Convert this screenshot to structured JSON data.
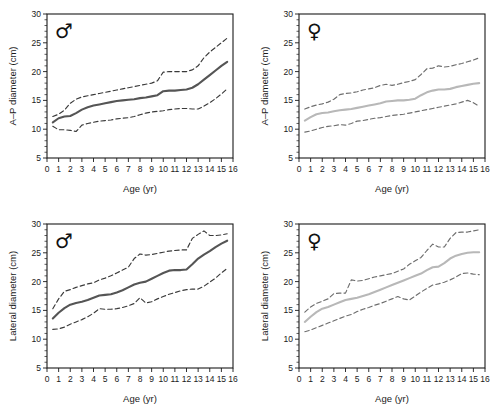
{
  "figure": {
    "title": "",
    "panels": [
      {
        "id": "ap-male",
        "sex_symbol": "♂",
        "sex_label": "male",
        "xlabel": "Age (yr)",
        "ylabel": "A–P diameter (cm)"
      },
      {
        "id": "ap-female",
        "sex_symbol": "♀",
        "sex_label": "female",
        "xlabel": "Age (yr)",
        "ylabel": "A–P diameter (cm)"
      },
      {
        "id": "lat-male",
        "sex_symbol": "♂",
        "sex_label": "male",
        "xlabel": "Age (yr)",
        "ylabel": "Lateral diameter (cm)"
      },
      {
        "id": "lat-female",
        "sex_symbol": "♀",
        "sex_label": "female",
        "xlabel": "Age (yr)",
        "ylabel": "Lateral diameter (cm)"
      }
    ]
  },
  "colors": {
    "axis": "#1a1a1a",
    "median_male": "#555555",
    "median_female": "#b8b8b8",
    "bound_male": "#3a3a3a",
    "bound_female": "#6e6e6e",
    "background": "#ffffff"
  },
  "chart_data": [
    {
      "type": "line",
      "id": "ap-male",
      "title": "A–P diameter, male",
      "xlabel": "Age (yr)",
      "ylabel": "A–P diameter (cm)",
      "xlim": [
        0,
        16
      ],
      "ylim": [
        5,
        30
      ],
      "xticks": [
        0,
        1,
        2,
        3,
        4,
        5,
        6,
        7,
        8,
        9,
        10,
        11,
        12,
        13,
        14,
        15,
        16
      ],
      "xticklabels": [
        "0",
        "1",
        "2",
        "3",
        "4",
        "5",
        "6",
        "7",
        "8",
        "9",
        "10",
        "11",
        "12",
        "13",
        "14",
        "15",
        "16"
      ],
      "yticks": [
        5,
        10,
        15,
        20,
        25,
        30
      ],
      "yticklabels": [
        "5",
        "10",
        "15",
        "20",
        "25",
        "30"
      ],
      "grid": false,
      "legend": "none",
      "annotations": [
        "♂"
      ],
      "x": [
        0.5,
        1,
        1.5,
        2,
        2.5,
        3,
        3.5,
        4,
        4.5,
        5,
        5.5,
        6,
        6.5,
        7,
        7.5,
        8,
        8.5,
        9,
        9.5,
        10,
        10.5,
        11,
        11.5,
        12,
        12.5,
        13,
        13.5,
        14,
        14.5,
        15,
        15.5
      ],
      "series": [
        {
          "name": "upper limit",
          "style": "dashed",
          "color": "#3a3a3a",
          "values": [
            12.2,
            12.6,
            13.3,
            14.5,
            15.2,
            15.6,
            15.8,
            16.0,
            16.2,
            16.4,
            16.6,
            16.8,
            17.0,
            17.2,
            17.4,
            17.6,
            17.8,
            18.0,
            18.4,
            19.9,
            20.0,
            20.0,
            20.0,
            20.0,
            20.3,
            21.0,
            22.4,
            23.4,
            24.2,
            25.0,
            25.8
          ]
        },
        {
          "name": "median",
          "style": "solid",
          "color": "#555555",
          "values": [
            11.2,
            11.9,
            12.2,
            12.3,
            12.8,
            13.4,
            13.8,
            14.1,
            14.3,
            14.5,
            14.7,
            14.9,
            15.0,
            15.1,
            15.2,
            15.4,
            15.5,
            15.7,
            15.9,
            16.6,
            16.7,
            16.7,
            16.8,
            16.9,
            17.2,
            17.8,
            18.6,
            19.4,
            20.2,
            21.0,
            21.7
          ]
        },
        {
          "name": "lower limit",
          "style": "dashed",
          "color": "#3a3a3a",
          "values": [
            10.5,
            9.9,
            9.9,
            9.8,
            9.6,
            10.7,
            11.0,
            11.2,
            11.4,
            11.5,
            11.6,
            11.8,
            11.9,
            12.0,
            12.2,
            12.5,
            12.8,
            13.0,
            13.1,
            13.2,
            13.4,
            13.5,
            13.6,
            13.6,
            13.5,
            13.5,
            14.0,
            14.6,
            15.3,
            16.1,
            17.0
          ]
        }
      ]
    },
    {
      "type": "line",
      "id": "ap-female",
      "title": "A–P diameter, female",
      "xlabel": "Age (yr)",
      "ylabel": "A–P diameter (cm)",
      "xlim": [
        0,
        16
      ],
      "ylim": [
        5,
        30
      ],
      "xticks": [
        0,
        1,
        2,
        3,
        4,
        5,
        6,
        7,
        8,
        9,
        10,
        11,
        12,
        13,
        14,
        15,
        16
      ],
      "xticklabels": [
        "0",
        "1",
        "2",
        "3",
        "4",
        "5",
        "6",
        "7",
        "8",
        "9",
        "10",
        "11",
        "12",
        "13",
        "14",
        "15",
        "16"
      ],
      "yticks": [
        5,
        10,
        15,
        20,
        25,
        30
      ],
      "yticklabels": [
        "5",
        "10",
        "15",
        "20",
        "25",
        "30"
      ],
      "grid": false,
      "legend": "none",
      "annotations": [
        "♀"
      ],
      "x": [
        0.5,
        1,
        1.5,
        2,
        2.5,
        3,
        3.5,
        4,
        4.5,
        5,
        5.5,
        6,
        6.5,
        7,
        7.5,
        8,
        8.5,
        9,
        9.5,
        10,
        10.5,
        11,
        11.5,
        12,
        12.5,
        13,
        13.5,
        14,
        14.5,
        15,
        15.5
      ],
      "series": [
        {
          "name": "upper limit",
          "style": "dashed",
          "color": "#6e6e6e",
          "values": [
            13.5,
            13.9,
            14.2,
            14.4,
            14.7,
            15.2,
            16.0,
            16.2,
            16.3,
            16.5,
            16.8,
            17.0,
            17.2,
            17.6,
            17.8,
            17.6,
            17.8,
            18.1,
            18.3,
            18.6,
            19.5,
            20.5,
            20.6,
            21.0,
            20.8,
            20.9,
            21.2,
            21.4,
            21.7,
            22.0,
            22.4
          ]
        },
        {
          "name": "median",
          "style": "solid",
          "color": "#b8b8b8",
          "values": [
            11.5,
            12.1,
            12.6,
            12.8,
            12.9,
            13.1,
            13.3,
            13.4,
            13.5,
            13.7,
            13.9,
            14.1,
            14.3,
            14.5,
            14.8,
            14.9,
            15.0,
            15.0,
            15.1,
            15.3,
            15.9,
            16.4,
            16.7,
            16.9,
            16.9,
            17.0,
            17.3,
            17.5,
            17.7,
            17.9,
            18.0
          ]
        },
        {
          "name": "lower limit",
          "style": "dashed",
          "color": "#6e6e6e",
          "values": [
            9.5,
            9.7,
            10.0,
            10.3,
            10.5,
            10.6,
            10.8,
            10.7,
            11.0,
            11.4,
            11.5,
            11.7,
            11.9,
            12.0,
            12.2,
            12.4,
            12.5,
            12.6,
            12.8,
            13.0,
            13.2,
            13.4,
            13.6,
            13.8,
            14.0,
            14.2,
            14.4,
            14.7,
            15.0,
            14.6,
            14.0
          ]
        }
      ]
    },
    {
      "type": "line",
      "id": "lat-male",
      "title": "Lateral diameter, male",
      "xlabel": "Age (yr)",
      "ylabel": "Lateral diameter (cm)",
      "xlim": [
        0,
        16
      ],
      "ylim": [
        5,
        30
      ],
      "xticks": [
        0,
        1,
        2,
        3,
        4,
        5,
        6,
        7,
        8,
        9,
        10,
        11,
        12,
        13,
        14,
        15,
        16
      ],
      "xticklabels": [
        "0",
        "1",
        "2",
        "3",
        "4",
        "5",
        "6",
        "7",
        "8",
        "9",
        "10",
        "11",
        "12",
        "13",
        "14",
        "15",
        "16"
      ],
      "yticks": [
        5,
        10,
        15,
        20,
        25,
        30
      ],
      "yticklabels": [
        "5",
        "10",
        "15",
        "20",
        "25",
        "30"
      ],
      "grid": false,
      "legend": "none",
      "annotations": [
        "♂"
      ],
      "x": [
        0.5,
        1,
        1.5,
        2,
        2.5,
        3,
        3.5,
        4,
        4.5,
        5,
        5.5,
        6,
        6.5,
        7,
        7.5,
        8,
        8.5,
        9,
        9.5,
        10,
        10.5,
        11,
        11.5,
        12,
        12.5,
        13,
        13.5,
        14,
        14.5,
        15,
        15.5
      ],
      "series": [
        {
          "name": "upper limit",
          "style": "dashed",
          "color": "#3a3a3a",
          "values": [
            15.3,
            17.0,
            18.3,
            18.6,
            19.0,
            19.3,
            19.6,
            19.8,
            20.3,
            20.6,
            21.0,
            21.5,
            22.0,
            22.5,
            24.0,
            24.8,
            24.6,
            24.7,
            24.9,
            25.1,
            25.3,
            25.4,
            25.5,
            25.5,
            27.5,
            28.2,
            28.8,
            28.0,
            28.0,
            28.1,
            28.3
          ]
        },
        {
          "name": "median",
          "style": "solid",
          "color": "#555555",
          "values": [
            13.6,
            14.6,
            15.4,
            16.0,
            16.3,
            16.5,
            16.8,
            17.2,
            17.6,
            17.7,
            17.8,
            18.1,
            18.5,
            19.0,
            19.5,
            19.8,
            20.0,
            20.5,
            21.0,
            21.5,
            21.9,
            22.0,
            22.0,
            22.1,
            23.0,
            24.0,
            24.7,
            25.3,
            26.0,
            26.6,
            27.1
          ]
        },
        {
          "name": "lower limit",
          "style": "dashed",
          "color": "#3a3a3a",
          "values": [
            11.7,
            11.8,
            12.1,
            12.6,
            13.0,
            13.4,
            13.9,
            14.5,
            15.3,
            15.2,
            15.2,
            15.3,
            15.5,
            15.8,
            16.2,
            17.2,
            16.3,
            16.5,
            17.0,
            17.4,
            17.8,
            18.1,
            18.4,
            18.6,
            18.7,
            18.7,
            19.2,
            19.9,
            20.6,
            21.5,
            22.3
          ]
        }
      ]
    },
    {
      "type": "line",
      "id": "lat-female",
      "title": "Lateral diameter, female",
      "xlabel": "Age (yr)",
      "ylabel": "Lateral diameter (cm)",
      "xlim": [
        0,
        16
      ],
      "ylim": [
        5,
        30
      ],
      "xticks": [
        0,
        1,
        2,
        3,
        4,
        5,
        6,
        7,
        8,
        9,
        10,
        11,
        12,
        13,
        14,
        15,
        16
      ],
      "xticklabels": [
        "0",
        "1",
        "2",
        "3",
        "4",
        "5",
        "6",
        "7",
        "8",
        "9",
        "10",
        "11",
        "12",
        "13",
        "14",
        "15",
        "16"
      ],
      "yticks": [
        5,
        10,
        15,
        20,
        25,
        30
      ],
      "yticklabels": [
        "5",
        "10",
        "15",
        "20",
        "25",
        "30"
      ],
      "grid": false,
      "legend": "none",
      "annotations": [
        "♀"
      ],
      "x": [
        0.5,
        1,
        1.5,
        2,
        2.5,
        3,
        3.5,
        4,
        4.5,
        5,
        5.5,
        6,
        6.5,
        7,
        7.5,
        8,
        8.5,
        9,
        9.5,
        10,
        10.5,
        11,
        11.5,
        12,
        12.5,
        13,
        13.5,
        14,
        14.5,
        15,
        15.5
      ],
      "series": [
        {
          "name": "upper limit",
          "style": "dashed",
          "color": "#6e6e6e",
          "values": [
            14.7,
            15.6,
            16.2,
            16.6,
            17.0,
            17.9,
            18.0,
            18.0,
            20.3,
            20.1,
            20.2,
            20.5,
            20.8,
            21.0,
            21.2,
            21.4,
            21.8,
            22.2,
            23.0,
            23.6,
            24.2,
            25.4,
            26.5,
            26.0,
            26.0,
            27.5,
            28.5,
            28.6,
            28.6,
            28.8,
            29.0
          ]
        },
        {
          "name": "median",
          "style": "solid",
          "color": "#b8b8b8",
          "values": [
            13.0,
            13.9,
            14.7,
            15.3,
            15.6,
            16.0,
            16.4,
            16.8,
            17.0,
            17.2,
            17.5,
            17.8,
            18.2,
            18.6,
            19.0,
            19.4,
            19.8,
            20.2,
            20.6,
            21.0,
            21.4,
            22.0,
            22.5,
            22.6,
            23.2,
            24.0,
            24.5,
            24.8,
            25.0,
            25.1,
            25.1
          ]
        },
        {
          "name": "lower limit",
          "style": "dashed",
          "color": "#6e6e6e",
          "values": [
            11.3,
            11.6,
            12.0,
            12.4,
            12.8,
            13.2,
            13.6,
            14.0,
            14.3,
            14.8,
            15.2,
            15.5,
            15.9,
            16.2,
            16.6,
            17.0,
            17.4,
            17.0,
            16.8,
            17.5,
            18.2,
            18.8,
            19.4,
            19.6,
            19.9,
            20.3,
            20.8,
            21.4,
            21.5,
            21.3,
            21.2
          ]
        }
      ]
    }
  ]
}
